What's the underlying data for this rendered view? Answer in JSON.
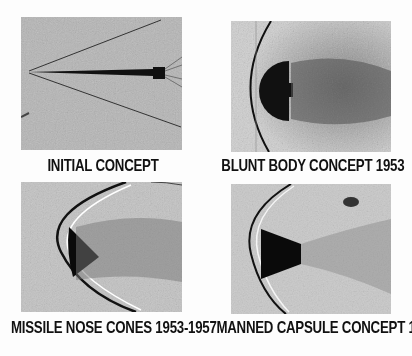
{
  "figure": {
    "panels": [
      {
        "id": "initial",
        "caption": "INITIAL CONCEPT",
        "subject": "slender-needle-body",
        "background": "#b3b3b3"
      },
      {
        "id": "blunt",
        "caption": "BLUNT BODY CONCEPT 1953",
        "subject": "blunt-hemisphere-body",
        "background": "#c4c4c4"
      },
      {
        "id": "missile",
        "caption": "MISSILE NOSE CONES 1953-1957",
        "subject": "missile-nose-cone",
        "background": "#c2c2c2"
      },
      {
        "id": "capsule",
        "caption": "MANNED CAPSULE CONCEPT 1957",
        "subject": "manned-capsule",
        "background": "#cbcbcb"
      }
    ]
  }
}
